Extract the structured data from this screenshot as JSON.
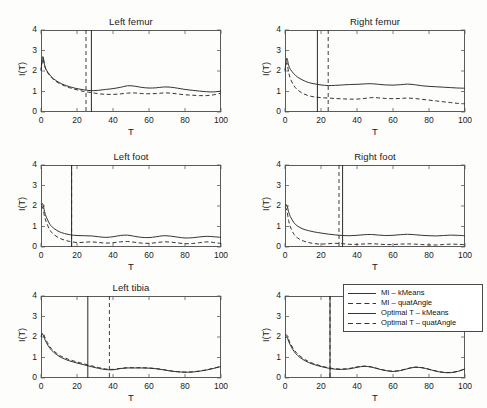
{
  "figure": {
    "background": "#fdfdfc",
    "line_color": "#2a2a2a",
    "axis_color": "#5a5a5a"
  },
  "axes": {
    "xlabel": "T",
    "ylabel": "I(T)",
    "xticks": [
      "0",
      "20",
      "40",
      "60",
      "80",
      "100"
    ],
    "yticks": [
      "0",
      "1",
      "2",
      "3",
      "4"
    ],
    "xlim": [
      0,
      100
    ],
    "ylim": [
      0,
      4
    ],
    "grid": false
  },
  "legend": {
    "position": "lower-right-panel",
    "entries": [
      {
        "label": "MI – kMeans",
        "style": "solid"
      },
      {
        "label": "MI – quatAngle",
        "style": "dashed"
      },
      {
        "label": "Optimal T – kMeans",
        "style": "solid"
      },
      {
        "label": "Optimal T – quatAngle",
        "style": "dashed"
      }
    ]
  },
  "chart_data": {
    "type": "line",
    "xlabel": "T",
    "ylabel": "I(T)",
    "xlim": [
      0,
      100
    ],
    "ylim": [
      0,
      4
    ],
    "xticks": [
      0,
      20,
      40,
      60,
      80,
      100
    ],
    "yticks": [
      0,
      1,
      2,
      3,
      4
    ],
    "grid": false,
    "layout": {
      "rows": 3,
      "cols": 2
    },
    "panels": [
      {
        "title": "Left femur",
        "row": 0,
        "col": 0,
        "optimal_T_kMeans": 28,
        "optimal_T_quatAngle": 25,
        "series": [
          {
            "name": "MI – kMeans",
            "style": "solid",
            "x": [
              0,
              1,
              2,
              3,
              5,
              7,
              10,
              13,
              16,
              20,
              24,
              28,
              32,
              36,
              40,
              44,
              48,
              52,
              56,
              60,
              64,
              68,
              72,
              76,
              80,
              84,
              88,
              92,
              96,
              100
            ],
            "y": [
              2.05,
              2.7,
              2.3,
              2.05,
              1.8,
              1.62,
              1.44,
              1.32,
              1.23,
              1.14,
              1.08,
              1.04,
              1.06,
              1.1,
              1.14,
              1.2,
              1.28,
              1.26,
              1.2,
              1.17,
              1.18,
              1.22,
              1.21,
              1.16,
              1.1,
              1.06,
              1.02,
              0.99,
              0.98,
              1.02
            ]
          },
          {
            "name": "MI – quatAngle",
            "style": "dashed",
            "x": [
              0,
              1,
              2,
              3,
              5,
              7,
              10,
              13,
              16,
              20,
              24,
              28,
              32,
              36,
              40,
              44,
              48,
              52,
              56,
              60,
              64,
              68,
              72,
              76,
              80,
              84,
              88,
              92,
              96,
              100
            ],
            "y": [
              2.0,
              2.6,
              2.25,
              2.02,
              1.76,
              1.58,
              1.4,
              1.28,
              1.18,
              1.08,
              1.0,
              0.95,
              0.89,
              0.86,
              0.86,
              0.88,
              0.92,
              0.93,
              0.9,
              0.89,
              0.9,
              0.93,
              0.92,
              0.88,
              0.84,
              0.82,
              0.8,
              0.8,
              0.84,
              0.92
            ]
          }
        ]
      },
      {
        "title": "Right femur",
        "row": 0,
        "col": 1,
        "optimal_T_kMeans": 18,
        "optimal_T_quatAngle": 24,
        "series": [
          {
            "name": "MI – kMeans",
            "style": "solid",
            "x": [
              0,
              1,
              2,
              3,
              5,
              7,
              10,
              13,
              16,
              20,
              24,
              28,
              32,
              36,
              40,
              44,
              48,
              52,
              56,
              60,
              64,
              68,
              72,
              76,
              80,
              84,
              88,
              92,
              96,
              100
            ],
            "y": [
              2.05,
              2.62,
              2.28,
              2.08,
              1.86,
              1.7,
              1.55,
              1.44,
              1.38,
              1.32,
              1.29,
              1.3,
              1.32,
              1.34,
              1.35,
              1.37,
              1.38,
              1.35,
              1.32,
              1.31,
              1.33,
              1.36,
              1.33,
              1.28,
              1.25,
              1.23,
              1.21,
              1.19,
              1.17,
              1.16
            ]
          },
          {
            "name": "MI – quatAngle",
            "style": "dashed",
            "x": [
              0,
              1,
              2,
              3,
              5,
              7,
              10,
              13,
              16,
              20,
              24,
              28,
              32,
              36,
              40,
              44,
              48,
              52,
              56,
              60,
              64,
              68,
              72,
              76,
              80,
              84,
              88,
              92,
              96,
              100
            ],
            "y": [
              1.98,
              2.4,
              1.95,
              1.62,
              1.28,
              1.08,
              0.9,
              0.8,
              0.74,
              0.7,
              0.68,
              0.66,
              0.64,
              0.63,
              0.63,
              0.66,
              0.7,
              0.69,
              0.66,
              0.65,
              0.66,
              0.68,
              0.66,
              0.62,
              0.58,
              0.54,
              0.5,
              0.46,
              0.42,
              0.4
            ]
          }
        ]
      },
      {
        "title": "Left foot",
        "row": 1,
        "col": 0,
        "optimal_T_kMeans": 17,
        "optimal_T_quatAngle": 17,
        "series": [
          {
            "name": "MI – kMeans",
            "style": "solid",
            "x": [
              0,
              1,
              2,
              3,
              5,
              7,
              10,
              13,
              16,
              20,
              24,
              28,
              32,
              36,
              40,
              44,
              48,
              52,
              56,
              60,
              64,
              68,
              72,
              76,
              80,
              84,
              88,
              92,
              96,
              100
            ],
            "y": [
              2.05,
              2.1,
              1.72,
              1.45,
              1.1,
              0.92,
              0.75,
              0.66,
              0.6,
              0.56,
              0.55,
              0.54,
              0.5,
              0.47,
              0.5,
              0.56,
              0.58,
              0.52,
              0.47,
              0.46,
              0.5,
              0.55,
              0.53,
              0.48,
              0.44,
              0.45,
              0.49,
              0.52,
              0.5,
              0.47
            ]
          },
          {
            "name": "MI – quatAngle",
            "style": "dashed",
            "x": [
              0,
              1,
              2,
              3,
              5,
              7,
              10,
              13,
              16,
              20,
              24,
              28,
              32,
              36,
              40,
              44,
              48,
              52,
              56,
              60,
              64,
              68,
              72,
              76,
              80,
              84,
              88,
              92,
              96,
              100
            ],
            "y": [
              2.0,
              1.9,
              1.48,
              1.2,
              0.82,
              0.62,
              0.44,
              0.34,
              0.27,
              0.22,
              0.23,
              0.25,
              0.22,
              0.19,
              0.21,
              0.25,
              0.27,
              0.23,
              0.19,
              0.18,
              0.21,
              0.25,
              0.24,
              0.2,
              0.16,
              0.17,
              0.21,
              0.25,
              0.22,
              0.17
            ]
          }
        ]
      },
      {
        "title": "Right foot",
        "row": 1,
        "col": 1,
        "optimal_T_kMeans": 32,
        "optimal_T_quatAngle": 30,
        "series": [
          {
            "name": "MI – kMeans",
            "style": "solid",
            "x": [
              0,
              1,
              2,
              3,
              5,
              7,
              10,
              13,
              16,
              20,
              24,
              28,
              32,
              36,
              40,
              44,
              48,
              52,
              56,
              60,
              64,
              68,
              72,
              76,
              80,
              84,
              88,
              92,
              96,
              100
            ],
            "y": [
              2.02,
              2.05,
              1.72,
              1.48,
              1.18,
              1.02,
              0.88,
              0.8,
              0.74,
              0.68,
              0.63,
              0.59,
              0.56,
              0.55,
              0.57,
              0.6,
              0.61,
              0.58,
              0.56,
              0.57,
              0.6,
              0.62,
              0.6,
              0.57,
              0.55,
              0.54,
              0.56,
              0.58,
              0.57,
              0.55
            ]
          },
          {
            "name": "MI – quatAngle",
            "style": "dashed",
            "x": [
              0,
              1,
              2,
              3,
              5,
              7,
              10,
              13,
              16,
              20,
              24,
              28,
              32,
              36,
              40,
              44,
              48,
              52,
              56,
              60,
              64,
              68,
              72,
              76,
              80,
              84,
              88,
              92,
              96,
              100
            ],
            "y": [
              1.96,
              1.8,
              1.3,
              0.98,
              0.62,
              0.44,
              0.3,
              0.22,
              0.17,
              0.14,
              0.16,
              0.18,
              0.16,
              0.13,
              0.13,
              0.15,
              0.16,
              0.14,
              0.12,
              0.12,
              0.14,
              0.15,
              0.14,
              0.12,
              0.1,
              0.1,
              0.12,
              0.14,
              0.13,
              0.11
            ]
          }
        ]
      },
      {
        "title": "Left tibia",
        "row": 2,
        "col": 0,
        "optimal_T_kMeans": 26,
        "optimal_T_quatAngle": 38,
        "series": [
          {
            "name": "MI – kMeans",
            "style": "solid",
            "x": [
              0,
              1,
              2,
              3,
              5,
              7,
              10,
              13,
              16,
              20,
              24,
              28,
              32,
              36,
              40,
              44,
              48,
              52,
              56,
              60,
              64,
              68,
              72,
              76,
              80,
              84,
              88,
              92,
              96,
              100
            ],
            "y": [
              2.05,
              2.12,
              1.92,
              1.72,
              1.44,
              1.26,
              1.06,
              0.93,
              0.83,
              0.73,
              0.64,
              0.55,
              0.47,
              0.41,
              0.4,
              0.46,
              0.49,
              0.49,
              0.49,
              0.48,
              0.45,
              0.4,
              0.34,
              0.3,
              0.28,
              0.29,
              0.33,
              0.39,
              0.47,
              0.56
            ]
          },
          {
            "name": "MI – quatAngle",
            "style": "dashed",
            "x": [
              0,
              1,
              2,
              3,
              5,
              7,
              10,
              13,
              16,
              20,
              24,
              28,
              32,
              36,
              40,
              44,
              48,
              52,
              56,
              60,
              64,
              68,
              72,
              76,
              80,
              84,
              88,
              92,
              96,
              100
            ],
            "y": [
              2.0,
              2.2,
              2.02,
              1.82,
              1.52,
              1.33,
              1.12,
              0.99,
              0.89,
              0.78,
              0.69,
              0.6,
              0.51,
              0.44,
              0.42,
              0.47,
              0.5,
              0.5,
              0.5,
              0.49,
              0.46,
              0.41,
              0.35,
              0.31,
              0.29,
              0.3,
              0.34,
              0.4,
              0.48,
              0.57
            ]
          }
        ]
      },
      {
        "title": "Right tibia",
        "row": 2,
        "col": 1,
        "optimal_T_kMeans": 25,
        "optimal_T_quatAngle": 25,
        "series": [
          {
            "name": "MI – kMeans",
            "style": "solid",
            "x": [
              0,
              1,
              2,
              3,
              5,
              7,
              10,
              13,
              16,
              20,
              24,
              28,
              32,
              36,
              40,
              44,
              48,
              52,
              56,
              60,
              64,
              68,
              72,
              76,
              80,
              84,
              88,
              92,
              96,
              100
            ],
            "y": [
              1.95,
              2.0,
              1.8,
              1.6,
              1.3,
              1.1,
              0.9,
              0.76,
              0.66,
              0.56,
              0.48,
              0.43,
              0.42,
              0.45,
              0.52,
              0.57,
              0.53,
              0.44,
              0.36,
              0.32,
              0.36,
              0.45,
              0.52,
              0.5,
              0.42,
              0.33,
              0.27,
              0.26,
              0.32,
              0.44
            ]
          },
          {
            "name": "MI – quatAngle",
            "style": "dashed",
            "x": [
              0,
              1,
              2,
              3,
              5,
              7,
              10,
              13,
              16,
              20,
              24,
              28,
              32,
              36,
              40,
              44,
              48,
              52,
              56,
              60,
              64,
              68,
              72,
              76,
              80,
              84,
              88,
              92,
              96,
              100
            ],
            "y": [
              2.05,
              2.1,
              1.88,
              1.68,
              1.38,
              1.18,
              0.96,
              0.81,
              0.7,
              0.59,
              0.5,
              0.45,
              0.44,
              0.47,
              0.54,
              0.58,
              0.54,
              0.45,
              0.37,
              0.33,
              0.37,
              0.46,
              0.53,
              0.51,
              0.43,
              0.34,
              0.28,
              0.27,
              0.33,
              0.45
            ]
          }
        ]
      }
    ]
  }
}
